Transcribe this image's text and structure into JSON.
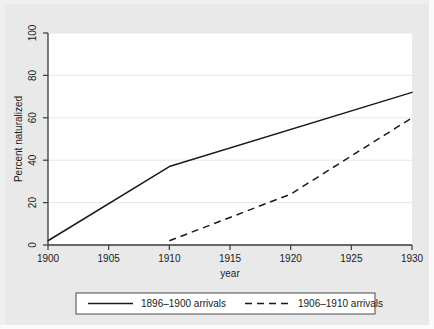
{
  "figure": {
    "background_color": "#e9e9e9",
    "plot_background_color": "#ffffff",
    "axis_color": "#3a3a3a",
    "grid_color": "#e6e6e6",
    "series_color": "#1a1a1a"
  },
  "chart_data": {
    "type": "line",
    "title": "",
    "subtitle": "",
    "xlabel": "year",
    "ylabel": "Percent naturalized",
    "xlim": [
      1900,
      1930
    ],
    "ylim": [
      0,
      100
    ],
    "xticks": [
      1900,
      1905,
      1910,
      1915,
      1920,
      1925,
      1930
    ],
    "xtick_labels": [
      "1900",
      "1905",
      "1910",
      "1915",
      "1920",
      "1925",
      "1930"
    ],
    "yticks": [
      0,
      20,
      40,
      60,
      80,
      100
    ],
    "ytick_labels": [
      "0",
      "20",
      "40",
      "60",
      "80",
      "100"
    ],
    "grid": "horizontal",
    "legend_position": "below",
    "series": [
      {
        "name": "1896-1900 arrivals",
        "style": "solid",
        "x": [
          1900,
          1910,
          1930
        ],
        "values": [
          2,
          37,
          72
        ]
      },
      {
        "name": "1906-1910 arrivals",
        "style": "dashed",
        "x": [
          1910,
          1920,
          1930
        ],
        "values": [
          2,
          24,
          60
        ]
      }
    ]
  },
  "legend": {
    "items": [
      {
        "label": "1896–1900 arrivals",
        "style": "solid"
      },
      {
        "label": "1906–1910 arrivals",
        "style": "dashed"
      }
    ]
  },
  "axes": {
    "x_title": "year",
    "y_title": "Percent naturalized",
    "x_labels": [
      "1900",
      "1905",
      "1910",
      "1915",
      "1920",
      "1925",
      "1930"
    ],
    "y_labels": [
      "0",
      "20",
      "40",
      "60",
      "80",
      "100"
    ]
  }
}
